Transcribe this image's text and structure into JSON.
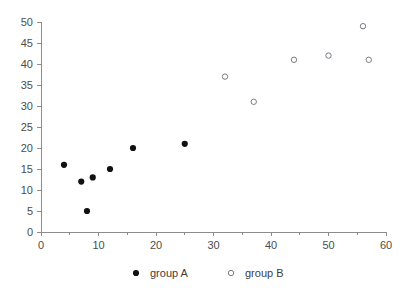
{
  "chart_data": {
    "type": "scatter",
    "title": "",
    "xlabel": "",
    "ylabel": "",
    "xlim": [
      0,
      60
    ],
    "ylim": [
      0,
      50
    ],
    "grid": false,
    "legend_position": "bottom-center",
    "xticks": [
      0,
      10,
      20,
      30,
      40,
      50,
      60
    ],
    "yticks": [
      0,
      5,
      10,
      15,
      20,
      25,
      30,
      35,
      40,
      45,
      50
    ],
    "xtick_labels": [
      "0",
      "10",
      "20",
      "30",
      "40",
      "50",
      "60"
    ],
    "ytick_labels": [
      "0",
      "5",
      "10",
      "15",
      "20",
      "25",
      "30",
      "35",
      "40",
      "45",
      "50"
    ],
    "x_minor_ticks": [
      5,
      15,
      25,
      35,
      45,
      55
    ],
    "series": [
      {
        "name": "group A",
        "marker": "filled-circle",
        "color": "#111111",
        "points": [
          {
            "x": 4,
            "y": 16
          },
          {
            "x": 7,
            "y": 12
          },
          {
            "x": 8,
            "y": 5
          },
          {
            "x": 9,
            "y": 13
          },
          {
            "x": 12,
            "y": 15
          },
          {
            "x": 16,
            "y": 20
          },
          {
            "x": 25,
            "y": 21
          }
        ]
      },
      {
        "name": "group B",
        "marker": "open-circle",
        "color": "#7a7a85",
        "points": [
          {
            "x": 32,
            "y": 37
          },
          {
            "x": 37,
            "y": 31
          },
          {
            "x": 44,
            "y": 41
          },
          {
            "x": 50,
            "y": 42
          },
          {
            "x": 56,
            "y": 49
          },
          {
            "x": 57,
            "y": 41
          }
        ]
      }
    ]
  },
  "legend": {
    "entries": [
      {
        "label": "group A",
        "marker": "filled-circle"
      },
      {
        "label": "group B",
        "marker": "open-circle"
      }
    ]
  },
  "colors": {
    "axis": "#8c8c8c",
    "tick_text": "#4d4d4d",
    "group_a": "#111111",
    "group_b": "#7a7a85",
    "background": "#ffffff"
  }
}
